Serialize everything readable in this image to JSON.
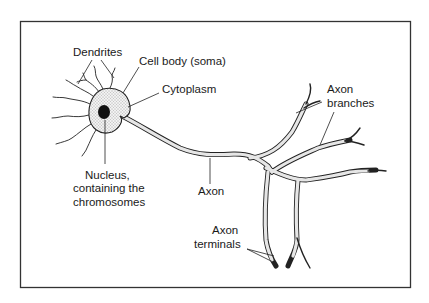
{
  "diagram": {
    "labels": {
      "dendrites": "Dendrites",
      "cell_body": "Cell body (soma)",
      "cytoplasm": "Cytoplasm",
      "nucleus_line1": "Nucleus,",
      "nucleus_line2": "containing the",
      "nucleus_line3": "chromosomes",
      "axon": "Axon",
      "axon_branches_line1": "Axon",
      "axon_branches_line2": "branches",
      "axon_terminals_line1": "Axon",
      "axon_terminals_line2": "terminals"
    },
    "colors": {
      "line": "#222222",
      "frame": "#333333",
      "cytoplasm_fill": "#e6e6e6",
      "nucleus_fill": "#111111",
      "background": "#ffffff"
    }
  }
}
